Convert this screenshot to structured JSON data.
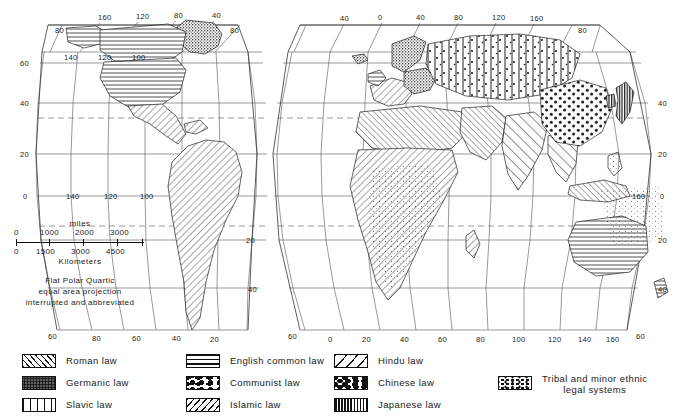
{
  "figure": {
    "kind": "thematic-world-map",
    "projection_note": [
      "Flat Polar Quartic",
      "equal area projection",
      "interrupted and abbreviated"
    ]
  },
  "scale": {
    "miles_label": "miles",
    "miles_ticks": [
      "0",
      "1000",
      "2000",
      "3000"
    ],
    "km_ticks": [
      "0",
      "1500",
      "3000",
      "4500"
    ],
    "km_label": "Kilometers"
  },
  "graticule": {
    "top_left_lon": [
      "160",
      "120",
      "80",
      "40"
    ],
    "top_left_lat": [
      "80",
      "80"
    ],
    "top_right_lon": [
      "40",
      "0",
      "40",
      "80",
      "120",
      "160"
    ],
    "top_right_lat": [
      "80"
    ],
    "left_lat": [
      "60",
      "40",
      "20",
      "0"
    ],
    "right_lat": [
      "40",
      "20",
      "0",
      "20",
      "40"
    ],
    "right_inner_lon": [
      "160"
    ],
    "inner_left_lon": [
      "140",
      "120",
      "100"
    ],
    "inner_lower_left_lon": [
      "140",
      "120",
      "100"
    ],
    "inner_lower_lat": [
      "20",
      "40"
    ],
    "bottom_left_lat": [
      "60"
    ],
    "bottom_left_lon": [
      "80",
      "60",
      "40",
      "20"
    ],
    "bottom_mid_lat": [
      "60"
    ],
    "bottom_right_lon": [
      "0",
      "20",
      "40",
      "60",
      "80",
      "100",
      "120",
      "140",
      "160"
    ],
    "bottom_right_lat": [
      "60"
    ],
    "sa_lat": [
      "20",
      "40"
    ],
    "sa_lon": [
      "20",
      "40",
      "60",
      "80"
    ]
  },
  "legend": {
    "columns": [
      {
        "items": [
          {
            "label": "Roman law",
            "pattern": "pat-roman",
            "icon": "diagonal-hatch-swatch"
          },
          {
            "label": "Germanic law",
            "pattern": "pat-germanic",
            "icon": "stipple-swatch"
          },
          {
            "label": "Slavic law",
            "pattern": "pat-slavic",
            "icon": "vertical-lines-swatch"
          }
        ]
      },
      {
        "items": [
          {
            "label": "English common law",
            "pattern": "pat-english",
            "icon": "horizontal-lines-swatch"
          },
          {
            "label": "Communist law",
            "pattern": "pat-communist",
            "icon": "sparse-dots-swatch"
          },
          {
            "label": "Islamic  law",
            "pattern": "pat-islamic",
            "icon": "back-diagonal-hatch-swatch"
          }
        ]
      },
      {
        "items": [
          {
            "label": "Hindu law",
            "pattern": "pat-hindu",
            "icon": "wide-diagonal-swatch"
          },
          {
            "label": "Chinese law",
            "pattern": "pat-chinese",
            "icon": "large-dots-swatch"
          },
          {
            "label": "Japanese law",
            "pattern": "pat-japanese",
            "icon": "dense-vertical-swatch"
          }
        ]
      },
      {
        "items": [
          {
            "label": "Tribal and minor ethnic\nlegal systems",
            "pattern": "pat-tribal",
            "icon": "fine-stipple-swatch"
          }
        ]
      }
    ]
  }
}
